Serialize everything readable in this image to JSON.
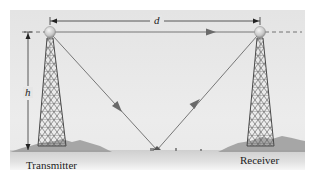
{
  "diagram": {
    "labels": {
      "transmitter": "Transmitter",
      "receiver": "Receiver",
      "distance_var": "d",
      "height_var": "h"
    },
    "colors": {
      "panel_bg": "#e6e6e6",
      "ground": "#bdbdbd",
      "tower": "#555555",
      "ray": "#777777",
      "arrowhead": "#6a6a6a",
      "dimension": "#333333",
      "text": "#222222"
    },
    "elements": {
      "transmitter_tower": {
        "top": [
          50,
          32
        ],
        "base_width": 28
      },
      "receiver_tower": {
        "top": [
          260,
          32
        ],
        "base_width": 28
      },
      "direct_ray": {
        "from": [
          50,
          32
        ],
        "to": [
          260,
          32
        ]
      },
      "reflected_ray": {
        "from": [
          50,
          32
        ],
        "reflection_point": [
          157,
          150
        ],
        "to": [
          260,
          32
        ]
      },
      "distance_dimension": {
        "y": 21,
        "from_x": 50,
        "to_x": 260
      },
      "height_dimension": {
        "x": 28,
        "from_y": 32,
        "to_y": 150
      }
    }
  }
}
